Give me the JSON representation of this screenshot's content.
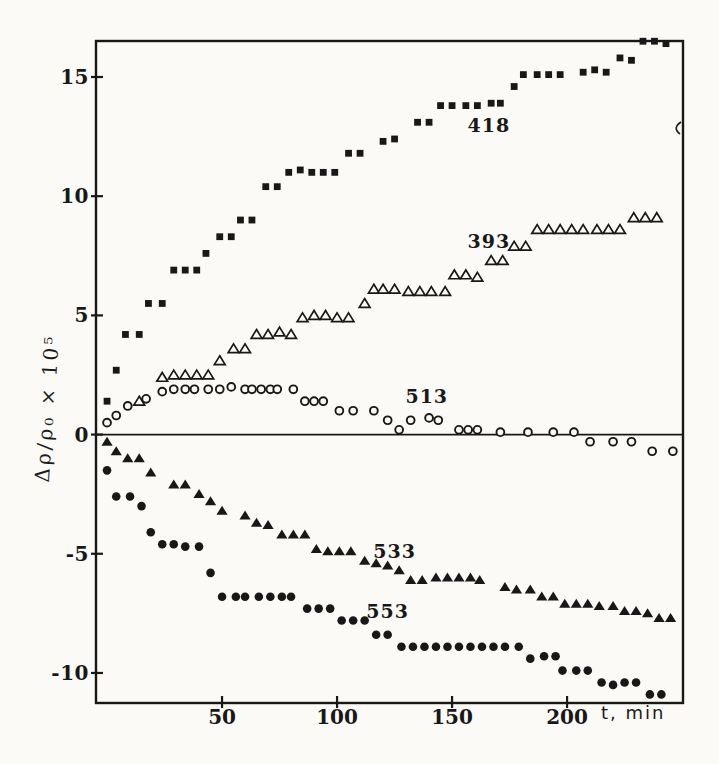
{
  "figure": {
    "ink": "#181818",
    "paper": "#fbfaf6",
    "stray_mark": {
      "x": 677,
      "y": 128
    }
  },
  "chart_data": {
    "type": "scatter",
    "title": "",
    "xlabel": "t, min",
    "ylabel": "Δρ/ρ₀ × 10⁵",
    "xlim": [
      -4.8,
      250.4
    ],
    "ylim": [
      -11.26,
      16.51
    ],
    "x_ticks": [
      50,
      100,
      150,
      200
    ],
    "y_ticks": [
      15,
      10,
      5,
      0,
      -5,
      -10
    ],
    "grid": false,
    "legend": "inline-annotations",
    "zero_line": true,
    "series": [
      {
        "name": "418",
        "marker": "filled-square",
        "points": [
          [
            0,
            1.4
          ],
          [
            4,
            2.7
          ],
          [
            8,
            4.2
          ],
          [
            14,
            4.2
          ],
          [
            18,
            5.5
          ],
          [
            24,
            5.5
          ],
          [
            29,
            6.9
          ],
          [
            34,
            6.9
          ],
          [
            39,
            6.9
          ],
          [
            43,
            7.6
          ],
          [
            49,
            8.3
          ],
          [
            54,
            8.3
          ],
          [
            58,
            9.0
          ],
          [
            63,
            9.0
          ],
          [
            69,
            10.4
          ],
          [
            74,
            10.4
          ],
          [
            79,
            11.0
          ],
          [
            84,
            11.1
          ],
          [
            89,
            11.0
          ],
          [
            94,
            11.0
          ],
          [
            99,
            11.0
          ],
          [
            105,
            11.8
          ],
          [
            110,
            11.8
          ],
          [
            120,
            12.3
          ],
          [
            125,
            12.4
          ],
          [
            135,
            13.1
          ],
          [
            140,
            13.1
          ],
          [
            145,
            13.8
          ],
          [
            150,
            13.8
          ],
          [
            156,
            13.8
          ],
          [
            161,
            13.8
          ],
          [
            167,
            13.9
          ],
          [
            171,
            13.9
          ],
          [
            177,
            14.6
          ],
          [
            181,
            15.1
          ],
          [
            187,
            15.1
          ],
          [
            192,
            15.1
          ],
          [
            197,
            15.1
          ],
          [
            207,
            15.2
          ],
          [
            212,
            15.3
          ],
          [
            217,
            15.2
          ],
          [
            223,
            15.8
          ],
          [
            228,
            15.7
          ],
          [
            233,
            16.5
          ],
          [
            238,
            16.5
          ],
          [
            243,
            16.4
          ]
        ]
      },
      {
        "name": "393",
        "marker": "open-triangle",
        "points": [
          [
            14,
            1.4
          ],
          [
            24,
            2.4
          ],
          [
            29,
            2.5
          ],
          [
            34,
            2.5
          ],
          [
            39,
            2.5
          ],
          [
            44,
            2.5
          ],
          [
            49,
            3.1
          ],
          [
            55,
            3.6
          ],
          [
            60,
            3.6
          ],
          [
            65,
            4.2
          ],
          [
            70,
            4.2
          ],
          [
            75,
            4.3
          ],
          [
            80,
            4.2
          ],
          [
            85,
            4.9
          ],
          [
            90,
            5.0
          ],
          [
            95,
            5.0
          ],
          [
            100,
            4.9
          ],
          [
            105,
            4.9
          ],
          [
            112,
            5.5
          ],
          [
            116,
            6.1
          ],
          [
            120,
            6.1
          ],
          [
            125,
            6.1
          ],
          [
            131,
            6.0
          ],
          [
            136,
            6.0
          ],
          [
            141,
            6.0
          ],
          [
            147,
            6.0
          ],
          [
            151,
            6.7
          ],
          [
            156,
            6.7
          ],
          [
            161,
            6.6
          ],
          [
            167,
            7.3
          ],
          [
            172,
            7.3
          ],
          [
            177,
            7.9
          ],
          [
            182,
            7.9
          ],
          [
            187,
            8.6
          ],
          [
            192,
            8.6
          ],
          [
            197,
            8.6
          ],
          [
            202,
            8.6
          ],
          [
            207,
            8.6
          ],
          [
            213,
            8.6
          ],
          [
            218,
            8.6
          ],
          [
            223,
            8.6
          ],
          [
            229,
            9.1
          ],
          [
            234,
            9.1
          ],
          [
            239,
            9.1
          ]
        ]
      },
      {
        "name": "513",
        "marker": "open-circle",
        "points": [
          [
            0,
            0.5
          ],
          [
            4,
            0.8
          ],
          [
            9,
            1.2
          ],
          [
            17,
            1.5
          ],
          [
            24,
            1.8
          ],
          [
            29,
            1.9
          ],
          [
            34,
            1.9
          ],
          [
            38,
            1.9
          ],
          [
            44,
            1.9
          ],
          [
            49,
            1.9
          ],
          [
            54,
            2.0
          ],
          [
            60,
            1.9
          ],
          [
            63,
            1.9
          ],
          [
            67,
            1.9
          ],
          [
            71,
            1.9
          ],
          [
            74,
            1.9
          ],
          [
            81,
            1.9
          ],
          [
            86,
            1.4
          ],
          [
            90,
            1.4
          ],
          [
            94,
            1.4
          ],
          [
            101,
            1.0
          ],
          [
            107,
            1.0
          ],
          [
            116,
            1.0
          ],
          [
            122,
            0.6
          ],
          [
            127,
            0.2
          ],
          [
            132,
            0.6
          ],
          [
            140,
            0.7
          ],
          [
            144,
            0.6
          ],
          [
            153,
            0.2
          ],
          [
            157,
            0.2
          ],
          [
            161,
            0.2
          ],
          [
            171,
            0.1
          ],
          [
            183,
            0.1
          ],
          [
            194,
            0.1
          ],
          [
            203,
            0.1
          ],
          [
            210,
            -0.3
          ],
          [
            220,
            -0.3
          ],
          [
            228,
            -0.3
          ],
          [
            237,
            -0.7
          ],
          [
            246,
            -0.7
          ]
        ]
      },
      {
        "name": "533",
        "marker": "filled-triangle",
        "points": [
          [
            0,
            -0.3
          ],
          [
            4,
            -0.7
          ],
          [
            9,
            -1.0
          ],
          [
            14,
            -1.0
          ],
          [
            19,
            -1.6
          ],
          [
            29,
            -2.1
          ],
          [
            34,
            -2.1
          ],
          [
            40,
            -2.5
          ],
          [
            45,
            -2.8
          ],
          [
            50,
            -3.2
          ],
          [
            60,
            -3.4
          ],
          [
            65,
            -3.7
          ],
          [
            70,
            -3.8
          ],
          [
            76,
            -4.2
          ],
          [
            81,
            -4.2
          ],
          [
            86,
            -4.2
          ],
          [
            91,
            -4.8
          ],
          [
            96,
            -4.9
          ],
          [
            101,
            -4.9
          ],
          [
            106,
            -4.9
          ],
          [
            112,
            -5.3
          ],
          [
            117,
            -5.4
          ],
          [
            122,
            -5.5
          ],
          [
            127,
            -5.7
          ],
          [
            132,
            -6.1
          ],
          [
            137,
            -6.1
          ],
          [
            143,
            -6.0
          ],
          [
            148,
            -6.0
          ],
          [
            153,
            -6.0
          ],
          [
            158,
            -6.0
          ],
          [
            162,
            -6.1
          ],
          [
            173,
            -6.4
          ],
          [
            178,
            -6.5
          ],
          [
            184,
            -6.5
          ],
          [
            189,
            -6.8
          ],
          [
            194,
            -6.8
          ],
          [
            199,
            -7.1
          ],
          [
            204,
            -7.1
          ],
          [
            209,
            -7.1
          ],
          [
            214,
            -7.2
          ],
          [
            220,
            -7.2
          ],
          [
            225,
            -7.4
          ],
          [
            230,
            -7.4
          ],
          [
            235,
            -7.5
          ],
          [
            240,
            -7.7
          ],
          [
            245,
            -7.7
          ]
        ]
      },
      {
        "name": "553",
        "marker": "filled-circle",
        "points": [
          [
            0,
            -1.5
          ],
          [
            4,
            -2.6
          ],
          [
            10,
            -2.6
          ],
          [
            15,
            -3.0
          ],
          [
            19,
            -4.1
          ],
          [
            24,
            -4.6
          ],
          [
            29,
            -4.6
          ],
          [
            34,
            -4.7
          ],
          [
            40,
            -4.7
          ],
          [
            45,
            -5.8
          ],
          [
            50,
            -6.8
          ],
          [
            56,
            -6.8
          ],
          [
            60,
            -6.8
          ],
          [
            66,
            -6.8
          ],
          [
            71,
            -6.8
          ],
          [
            76,
            -6.8
          ],
          [
            80,
            -6.8
          ],
          [
            87,
            -7.3
          ],
          [
            92,
            -7.3
          ],
          [
            97,
            -7.3
          ],
          [
            102,
            -7.8
          ],
          [
            107,
            -7.8
          ],
          [
            112,
            -7.8
          ],
          [
            117,
            -8.4
          ],
          [
            122,
            -8.4
          ],
          [
            128,
            -8.9
          ],
          [
            133,
            -8.9
          ],
          [
            138,
            -8.9
          ],
          [
            143,
            -8.9
          ],
          [
            148,
            -8.9
          ],
          [
            153,
            -8.9
          ],
          [
            158,
            -8.9
          ],
          [
            163,
            -8.9
          ],
          [
            168,
            -8.9
          ],
          [
            173,
            -8.9
          ],
          [
            179,
            -8.9
          ],
          [
            184,
            -9.4
          ],
          [
            190,
            -9.3
          ],
          [
            195,
            -9.3
          ],
          [
            198,
            -9.9
          ],
          [
            204,
            -9.9
          ],
          [
            209,
            -9.9
          ],
          [
            215,
            -10.4
          ],
          [
            220,
            -10.5
          ],
          [
            225,
            -10.4
          ],
          [
            230,
            -10.4
          ],
          [
            236,
            -10.9
          ],
          [
            241,
            -10.9
          ]
        ]
      }
    ],
    "annotations": [
      {
        "text": "418",
        "t": 166,
        "v": 13.0
      },
      {
        "text": "393",
        "t": 166,
        "v": 8.1
      },
      {
        "text": "513",
        "t": 139,
        "v": 1.6
      },
      {
        "text": "533",
        "t": 125,
        "v": -4.9
      },
      {
        "text": "553",
        "t": 122,
        "v": -7.4
      }
    ]
  }
}
